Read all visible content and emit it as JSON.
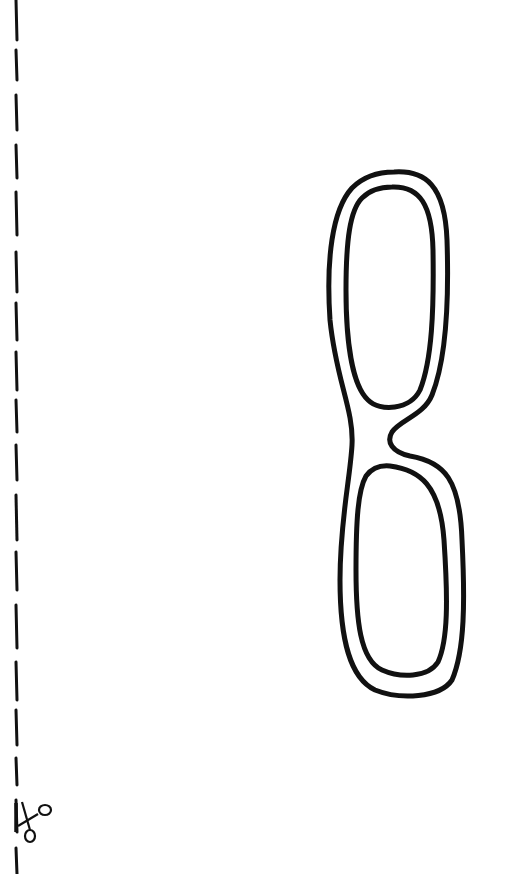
{
  "page": {
    "background": "#ffffff",
    "stroke_color": "#111111"
  },
  "cut_line": {
    "orientation": "vertical",
    "x": 16,
    "dashes": [
      [
        0,
        40
      ],
      [
        50,
        80
      ],
      [
        95,
        130
      ],
      [
        145,
        178
      ],
      [
        192,
        235
      ],
      [
        252,
        292
      ],
      [
        303,
        340
      ],
      [
        352,
        390
      ],
      [
        400,
        432
      ],
      [
        445,
        480
      ],
      [
        495,
        540
      ],
      [
        552,
        590
      ],
      [
        605,
        648
      ],
      [
        662,
        700
      ],
      [
        710,
        745
      ],
      [
        758,
        785
      ],
      [
        800,
        832
      ],
      [
        848,
        874
      ]
    ]
  },
  "scissors": {
    "icon": "scissors-icon",
    "x": 14,
    "y": 800
  },
  "glasses": {
    "icon": "eyeglasses-outline",
    "orientation": "vertical"
  }
}
